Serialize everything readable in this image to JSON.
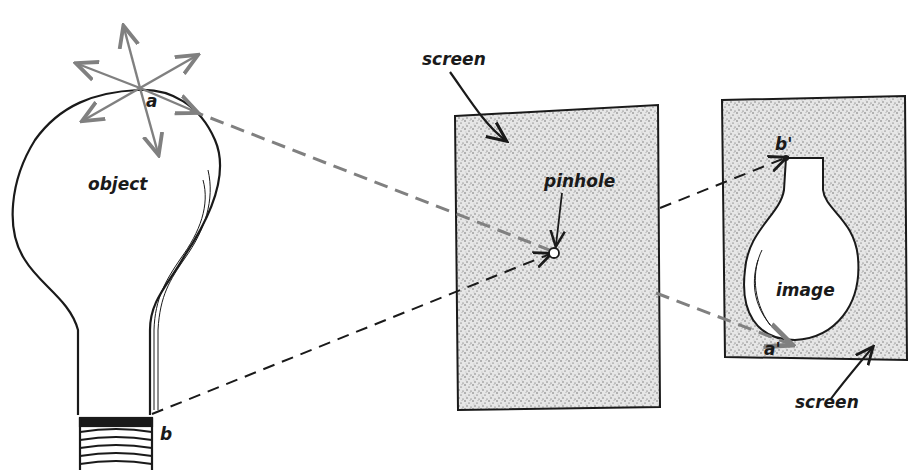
{
  "diagram": {
    "labels": {
      "point_a": "a",
      "point_b": "b",
      "object": "object",
      "screen_top": "screen",
      "pinhole": "pinhole",
      "image": "image",
      "point_b_prime": "b'",
      "point_a_prime": "a'",
      "screen_bottom": "screen"
    },
    "colors": {
      "ink": "#1a1a1a",
      "ray_gray": "#808080",
      "screen_fill": "#d9d9d9"
    }
  }
}
